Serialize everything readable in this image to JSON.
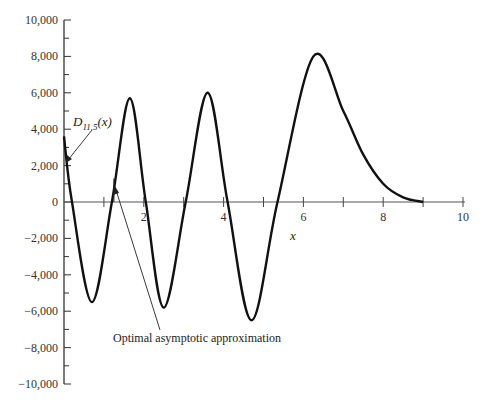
{
  "chart_data": {
    "type": "line",
    "title": "",
    "xlabel": "x",
    "ylabel": "",
    "xlim": [
      0,
      10
    ],
    "ylim": [
      -10000,
      10000
    ],
    "grid": false,
    "x_ticks": [
      0,
      2,
      4,
      6,
      8,
      10
    ],
    "x_tick_labels": [
      "",
      "2",
      "4",
      "6",
      "8",
      "10"
    ],
    "x_minor_ticks": [
      1,
      3,
      5,
      7,
      9
    ],
    "y_ticks": [
      -10000,
      -8000,
      -6000,
      -4000,
      -2000,
      0,
      2000,
      4000,
      6000,
      8000,
      10000
    ],
    "y_tick_labels": [
      "−10,000",
      "−8,000",
      "−6,000",
      "−4,000",
      "−2,000",
      "0",
      "2,000",
      "4,000",
      "6,000",
      "8,000",
      "10,000"
    ],
    "series": [
      {
        "name": "D_{11.5}(x)",
        "x": [
          0,
          0.2,
          0.7,
          1.2,
          1.65,
          2.05,
          2.5,
          3.05,
          3.6,
          4.1,
          4.7,
          5.35,
          6.25,
          7.0,
          7.5,
          8.0,
          8.5,
          9.0
        ],
        "values": [
          3600,
          0,
          -5500,
          0,
          5700,
          0,
          -5800,
          0,
          6000,
          0,
          -6500,
          0,
          8000,
          5000,
          2600,
          1000,
          250,
          0
        ]
      },
      {
        "name": "Optimal asymptotic approximation",
        "x": [
          1.25,
          1.25
        ],
        "values": [
          0,
          1300
        ]
      }
    ],
    "annotations": [
      {
        "text": "D11.5(x)",
        "points_to": [
          0.05,
          2300
        ]
      },
      {
        "text": "Optimal asymptotic approximation",
        "points_to": [
          1.3,
          1000
        ]
      }
    ]
  },
  "labels": {
    "curve_label_main": "D",
    "curve_label_sub": "11.5",
    "curve_label_arg": "(x)",
    "approx_label": "Optimal asymptotic approximation",
    "x_axis_label": "x"
  }
}
